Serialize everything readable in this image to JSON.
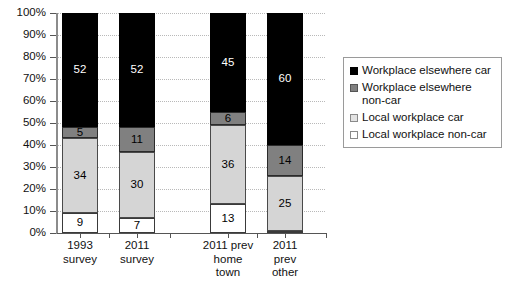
{
  "chart_data": {
    "type": "bar",
    "subtype": "100% stacked column",
    "title": "",
    "xlabel": "",
    "ylabel": "",
    "ylim": [
      0,
      100
    ],
    "ytick_labels": [
      "0%",
      "10%",
      "20%",
      "30%",
      "40%",
      "50%",
      "60%",
      "70%",
      "80%",
      "90%",
      "100%"
    ],
    "ytick_values": [
      0,
      10,
      20,
      30,
      40,
      50,
      60,
      70,
      80,
      90,
      100
    ],
    "grid": "horizontal dotted",
    "legend_position": "right",
    "categories": [
      "1993 survey",
      "2011 survey",
      "2011 prev home town",
      "2011 prev other"
    ],
    "category_lines": [
      [
        "1993",
        "survey"
      ],
      [
        "2011",
        "survey"
      ],
      [
        "2011 prev",
        "home",
        "town"
      ],
      [
        "2011",
        "prev",
        "other"
      ]
    ],
    "series": [
      {
        "name": "Local workplace non-car",
        "color": "#ffffff",
        "values": [
          9,
          7,
          13,
          1
        ],
        "labels": [
          "9",
          "7",
          "13",
          ""
        ]
      },
      {
        "name": "Local workplace car",
        "color": "#d5d5d5",
        "values": [
          34,
          30,
          36,
          25
        ],
        "labels": [
          "34",
          "30",
          "36",
          "25"
        ]
      },
      {
        "name": "Workplace elsewhere non-car",
        "color": "#808080",
        "values": [
          5,
          11,
          6,
          14
        ],
        "labels": [
          "5",
          "11",
          "6",
          "14"
        ]
      },
      {
        "name": "Workplace elsewhere car",
        "color": "#000000",
        "values": [
          52,
          52,
          45,
          60
        ],
        "labels": [
          "52",
          "52",
          "45",
          "60"
        ]
      }
    ]
  },
  "legend": {
    "entries": [
      {
        "label": "Workplace elsewhere car",
        "swatch": "black"
      },
      {
        "label": "Workplace elsewhere non-car",
        "swatch": "dark-gray"
      },
      {
        "label": "Local workplace car",
        "swatch": "light-gray"
      },
      {
        "label": "Local workplace non-car",
        "swatch": "white"
      }
    ]
  }
}
